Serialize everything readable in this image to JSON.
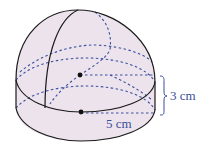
{
  "diagram": {
    "shape": "hemisphere on cylinder",
    "colors": {
      "fill": "#ece3ec",
      "outline": "#1a1a1a",
      "hidden_lines": "#3b4fa0",
      "label": "#3a4f9a"
    },
    "labels": {
      "height": "3 cm",
      "radius": "5 cm"
    }
  }
}
